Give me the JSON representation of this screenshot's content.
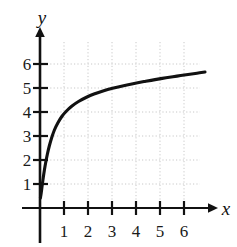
{
  "chart_data": {
    "type": "line",
    "title": "",
    "subtitle": "",
    "xlabel": "x",
    "ylabel": "y",
    "xlim": [
      -0.35,
      6.9
    ],
    "ylim": [
      -0.45,
      6.85
    ],
    "grid": true,
    "grid_style": "dotted",
    "grid_color": "#c8c8c8",
    "legend": false,
    "legend_position": "none",
    "axis_color": "#111111",
    "curve_color": "#111111",
    "x_ticks": [
      1,
      2,
      3,
      4,
      5,
      6
    ],
    "y_ticks": [
      1,
      2,
      3,
      4,
      5,
      6
    ],
    "x_tick_labels": [
      "1",
      "2",
      "3",
      "4",
      "5",
      "6"
    ],
    "y_tick_labels": [
      "1",
      "2",
      "3",
      "4",
      "5",
      "6"
    ],
    "series": [
      {
        "name": "logarithmic-curve",
        "x": [
          0.06,
          0.08,
          0.1,
          0.15,
          0.2,
          0.3,
          0.4,
          0.5,
          0.7,
          1.0,
          1.3,
          1.6,
          2.0,
          2.5,
          3.0,
          3.5,
          4.0,
          4.5,
          5.0,
          5.5,
          6.0,
          6.4
        ],
        "y": [
          1.84,
          2.23,
          2.51,
          3.03,
          3.38,
          3.87,
          4.21,
          4.48,
          4.87,
          5.33,
          5.62,
          5.85,
          6.1,
          6.37,
          6.57,
          6.75,
          6.9,
          7.03,
          7.15,
          7.26,
          7.35,
          7.42
        ]
      }
    ],
    "curve_points_px": [
      [
        40.4,
        198.0
      ],
      [
        41.2,
        193.0
      ],
      [
        42.1,
        186.0
      ],
      [
        43.2,
        178.0
      ],
      [
        44.4,
        170.0
      ],
      [
        45.8,
        162.0
      ],
      [
        47.4,
        154.0
      ],
      [
        49.3,
        146.0
      ],
      [
        51.6,
        138.0
      ],
      [
        54.4,
        130.0
      ],
      [
        57.8,
        123.0
      ],
      [
        61.8,
        116.5
      ],
      [
        66.5,
        111.0
      ],
      [
        72.0,
        106.0
      ],
      [
        78.5,
        101.5
      ],
      [
        86.0,
        97.5
      ],
      [
        94.0,
        94.0
      ],
      [
        103.0,
        91.0
      ],
      [
        112.5,
        88.3
      ],
      [
        122.5,
        85.9
      ],
      [
        133.0,
        83.7
      ],
      [
        144.0,
        81.6
      ],
      [
        155.0,
        79.6
      ],
      [
        166.0,
        77.8
      ],
      [
        177.0,
        76.1
      ],
      [
        188.0,
        74.5
      ],
      [
        197.0,
        73.2
      ],
      [
        205.0,
        72.0
      ]
    ]
  },
  "axes": {
    "y_axis_label": "y",
    "x_axis_label": "x",
    "origin_px": [
      40,
      208
    ],
    "unit_px": 24
  },
  "meta": {
    "canvas_width": 237,
    "canvas_height": 247
  }
}
